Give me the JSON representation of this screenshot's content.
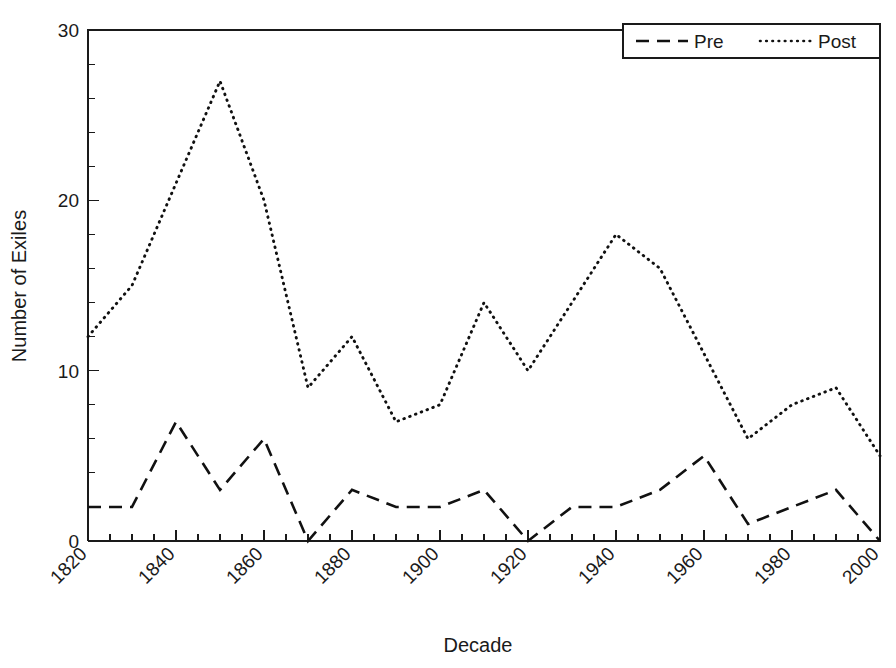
{
  "chart_data": {
    "type": "line",
    "title": "",
    "xlabel": "Decade",
    "ylabel": "Number of Exiles",
    "xlim": [
      1820,
      2000
    ],
    "ylim": [
      0,
      30
    ],
    "grid": false,
    "legend_position": "top-right",
    "x": [
      1820,
      1830,
      1840,
      1850,
      1860,
      1870,
      1880,
      1890,
      1900,
      1910,
      1920,
      1930,
      1940,
      1950,
      1960,
      1970,
      1980,
      1990,
      2000
    ],
    "series": [
      {
        "name": "Pre",
        "style": "dashed",
        "values": [
          2,
          2,
          7,
          3,
          6,
          0,
          3,
          2,
          2,
          3,
          0,
          2,
          2,
          3,
          5,
          1,
          2,
          3,
          0
        ]
      },
      {
        "name": "Post",
        "style": "dotted",
        "values": [
          12,
          15,
          21,
          27,
          20,
          9,
          12,
          7,
          8,
          14,
          10,
          14,
          18,
          16,
          11,
          6,
          8,
          9,
          5
        ]
      }
    ],
    "x_major_ticks": [
      1820,
      1840,
      1860,
      1880,
      1900,
      1920,
      1940,
      1960,
      1980,
      2000
    ],
    "x_minor_ticks": [
      1830,
      1850,
      1870,
      1890,
      1910,
      1930,
      1950,
      1970,
      1990
    ],
    "x_tick_labels": [
      "1820",
      "1840",
      "1860",
      "1880",
      "1900",
      "1920",
      "1940",
      "1960",
      "1980",
      "2000"
    ],
    "x_tick_label_rotation": -45,
    "y_major_ticks": [
      0,
      10,
      20,
      30
    ],
    "y_minor_ticks": [
      2,
      4,
      6,
      8,
      12,
      14,
      16,
      18,
      22,
      24,
      26,
      28
    ],
    "y_tick_labels": [
      "0",
      "10",
      "20",
      "30"
    ],
    "colors": {
      "axis": "#1a1a1a",
      "series_pre": "#111111",
      "series_post": "#111111",
      "background": "#ffffff"
    }
  },
  "legend": {
    "items": [
      {
        "label": "Pre",
        "style": "dashed"
      },
      {
        "label": "Post",
        "style": "dotted"
      }
    ]
  }
}
